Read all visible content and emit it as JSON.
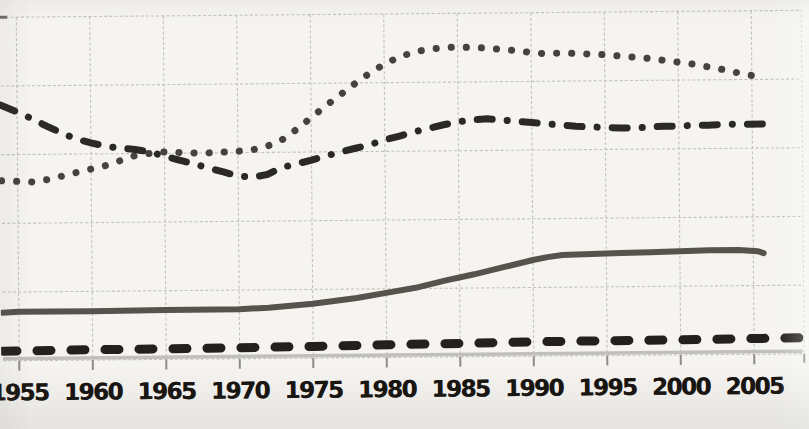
{
  "page": {
    "background_color": "#f5f4f1"
  },
  "chart_data": {
    "type": "line",
    "title": "",
    "xlabel": "",
    "ylabel": "",
    "x_tick_labels": [
      "1955",
      "1960",
      "1965",
      "1970",
      "1975",
      "1980",
      "1985",
      "1990",
      "1995",
      "2000",
      "2005"
    ],
    "x_tick_years": [
      1955,
      1960,
      1965,
      1970,
      1975,
      1980,
      1985,
      1990,
      1995,
      2000,
      2005
    ],
    "x_range": [
      1953.9,
      2008.3
    ],
    "y_range_grid_units": [
      0,
      5
    ],
    "y_gridline_units": [
      0,
      1,
      2,
      3,
      4,
      5
    ],
    "y_axis_labels_visible": false,
    "grid": true,
    "legend_position": "none",
    "grid_color": "#c3c1bb",
    "tick_color": "#8e8c87",
    "label_color": "#16130f",
    "series": [
      {
        "name": "dotted-series",
        "style": "dotted",
        "color": "#454240",
        "points": [
          [
            1953.9,
            2.62
          ],
          [
            1955,
            2.61
          ],
          [
            1956,
            2.6
          ],
          [
            1957,
            2.63
          ],
          [
            1958,
            2.68
          ],
          [
            1959,
            2.73
          ],
          [
            1960,
            2.78
          ],
          [
            1961,
            2.83
          ],
          [
            1962,
            2.9
          ],
          [
            1963,
            2.97
          ],
          [
            1964,
            3.0
          ],
          [
            1965,
            3.02
          ],
          [
            1966,
            3.01
          ],
          [
            1967,
            3.0
          ],
          [
            1968,
            3.0
          ],
          [
            1969,
            3.01
          ],
          [
            1970,
            3.02
          ],
          [
            1971,
            3.04
          ],
          [
            1972,
            3.09
          ],
          [
            1973,
            3.18
          ],
          [
            1974,
            3.33
          ],
          [
            1975,
            3.5
          ],
          [
            1976,
            3.67
          ],
          [
            1977,
            3.83
          ],
          [
            1978,
            3.99
          ],
          [
            1979,
            4.14
          ],
          [
            1980,
            4.27
          ],
          [
            1981,
            4.37
          ],
          [
            1982,
            4.44
          ],
          [
            1983,
            4.48
          ],
          [
            1984,
            4.5
          ],
          [
            1985,
            4.51
          ],
          [
            1986,
            4.5
          ],
          [
            1987,
            4.49
          ],
          [
            1988,
            4.47
          ],
          [
            1989,
            4.45
          ],
          [
            1990,
            4.42
          ],
          [
            1991,
            4.4
          ],
          [
            1992,
            4.41
          ],
          [
            1993,
            4.4
          ],
          [
            1994,
            4.39
          ],
          [
            1995,
            4.38
          ],
          [
            1996,
            4.36
          ],
          [
            1997,
            4.34
          ],
          [
            1998,
            4.32
          ],
          [
            1999,
            4.29
          ],
          [
            2000,
            4.26
          ],
          [
            2001,
            4.23
          ],
          [
            2002,
            4.19
          ],
          [
            2003,
            4.15
          ],
          [
            2004,
            4.1
          ],
          [
            2005.2,
            4.05
          ]
        ]
      },
      {
        "name": "dash-dot-series",
        "style": "dashdot",
        "color": "#2b2926",
        "points": [
          [
            1953.9,
            3.72
          ],
          [
            1955,
            3.62
          ],
          [
            1956,
            3.52
          ],
          [
            1957,
            3.41
          ],
          [
            1958,
            3.31
          ],
          [
            1959,
            3.22
          ],
          [
            1960,
            3.16
          ],
          [
            1961,
            3.11
          ],
          [
            1962,
            3.08
          ],
          [
            1963,
            3.06
          ],
          [
            1964,
            3.02
          ],
          [
            1965,
            2.96
          ],
          [
            1966,
            2.9
          ],
          [
            1967,
            2.84
          ],
          [
            1968,
            2.78
          ],
          [
            1969,
            2.72
          ],
          [
            1970,
            2.66
          ],
          [
            1971,
            2.64
          ],
          [
            1972,
            2.68
          ],
          [
            1973,
            2.78
          ],
          [
            1974,
            2.83
          ],
          [
            1975,
            2.88
          ],
          [
            1976,
            2.94
          ],
          [
            1977,
            3.0
          ],
          [
            1978,
            3.05
          ],
          [
            1979,
            3.1
          ],
          [
            1980,
            3.17
          ],
          [
            1981,
            3.22
          ],
          [
            1982,
            3.28
          ],
          [
            1983,
            3.33
          ],
          [
            1984,
            3.38
          ],
          [
            1985,
            3.42
          ],
          [
            1986,
            3.45
          ],
          [
            1987,
            3.46
          ],
          [
            1988,
            3.44
          ],
          [
            1989,
            3.42
          ],
          [
            1990,
            3.4
          ],
          [
            1991,
            3.38
          ],
          [
            1992,
            3.36
          ],
          [
            1993,
            3.34
          ],
          [
            1994,
            3.33
          ],
          [
            1995,
            3.32
          ],
          [
            1996,
            3.31
          ],
          [
            1997,
            3.31
          ],
          [
            1998,
            3.32
          ],
          [
            1999,
            3.33
          ],
          [
            2000,
            3.33
          ],
          [
            2001,
            3.34
          ],
          [
            2002,
            3.34
          ],
          [
            2003,
            3.35
          ],
          [
            2004,
            3.35
          ],
          [
            2006.2,
            3.35
          ]
        ]
      },
      {
        "name": "solid-series",
        "style": "solid",
        "color": "#56524c",
        "points": [
          [
            1953.9,
            0.7
          ],
          [
            1955,
            0.71
          ],
          [
            1960,
            0.71
          ],
          [
            1965,
            0.72
          ],
          [
            1970,
            0.72
          ],
          [
            1972,
            0.74
          ],
          [
            1975,
            0.79
          ],
          [
            1978,
            0.87
          ],
          [
            1980,
            0.94
          ],
          [
            1982,
            1.01
          ],
          [
            1984,
            1.11
          ],
          [
            1986,
            1.2
          ],
          [
            1988,
            1.3
          ],
          [
            1990,
            1.4
          ],
          [
            1991,
            1.44
          ],
          [
            1992,
            1.47
          ],
          [
            1994,
            1.48
          ],
          [
            1996,
            1.49
          ],
          [
            1998,
            1.5
          ],
          [
            2000,
            1.51
          ],
          [
            2002,
            1.52
          ],
          [
            2004,
            1.52
          ],
          [
            2005.3,
            1.5
          ],
          [
            2005.7,
            1.47
          ]
        ]
      },
      {
        "name": "dashed-series",
        "style": "dashed",
        "color": "#23201d",
        "points": [
          [
            1953.9,
            0.14
          ],
          [
            1960,
            0.15
          ],
          [
            1965,
            0.155
          ],
          [
            1970,
            0.16
          ],
          [
            1975,
            0.17
          ],
          [
            1980,
            0.185
          ],
          [
            1985,
            0.195
          ],
          [
            1990,
            0.21
          ],
          [
            1995,
            0.215
          ],
          [
            2000,
            0.22
          ],
          [
            2008.3,
            0.235
          ]
        ]
      },
      {
        "name": "light-gray-baseline-series",
        "style": "light",
        "color": "#c1bfb9",
        "points": [
          [
            1953.9,
            0.03
          ],
          [
            2008.3,
            0.04
          ]
        ]
      }
    ]
  }
}
